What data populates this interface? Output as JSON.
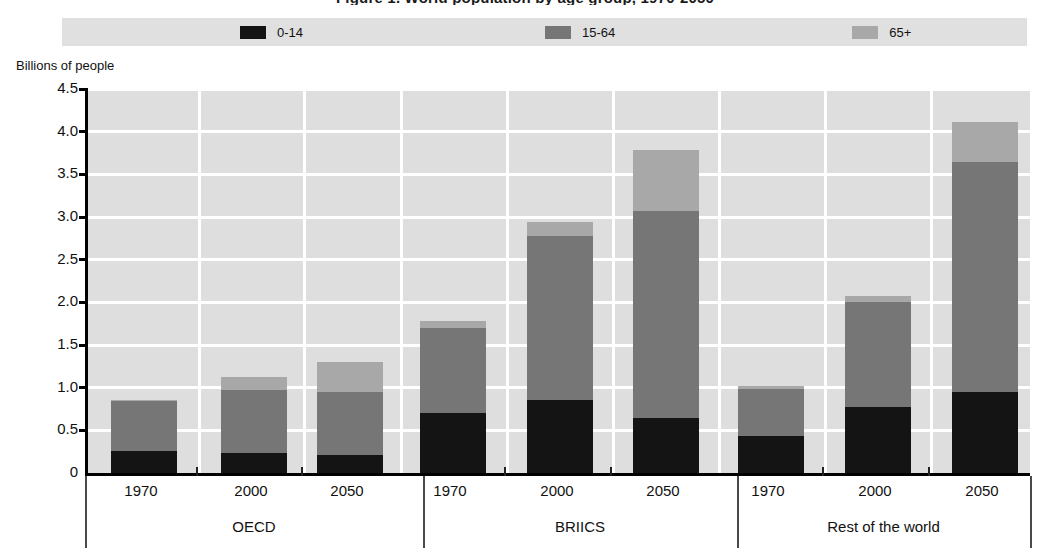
{
  "title": "Figure 1. World population by age group, 1970-2050",
  "legend": {
    "position": "top",
    "items": [
      {
        "label": "0-14",
        "color": "#141414",
        "icon": "legend-swatch"
      },
      {
        "label": "15-64",
        "color": "#767676",
        "icon": "legend-swatch"
      },
      {
        "label": "65+",
        "color": "#a8a8a8",
        "icon": "legend-swatch"
      }
    ]
  },
  "axes": {
    "y_caption": "Billions of people",
    "y_ticks": [
      "4.5",
      "4.0",
      "3.5",
      "3.0",
      "2.5",
      "2.0",
      "1.5",
      "1.0",
      "0.5",
      "0"
    ],
    "y_min": 0,
    "y_max": 4.5,
    "y_step": 0.5
  },
  "groups": [
    {
      "name": "OECD",
      "years": [
        "1970",
        "2000",
        "2050"
      ]
    },
    {
      "name": "BRIICS",
      "years": [
        "1970",
        "2000",
        "2050"
      ]
    },
    {
      "name": "Rest of the world",
      "years": [
        "1970",
        "2000",
        "2050"
      ]
    }
  ],
  "chart_data": {
    "type": "bar",
    "subtype": "stacked-grouped",
    "title": "Figure 1. World population by age group, 1970-2050",
    "xlabel": "",
    "ylabel": "Billions of people",
    "ylim": [
      0,
      4.5
    ],
    "ytick_step": 0.5,
    "grid": true,
    "legend_position": "top",
    "groups": [
      "OECD",
      "BRIICS",
      "Rest of the world"
    ],
    "categories": [
      "OECD 1970",
      "OECD 2000",
      "OECD 2050",
      "BRIICS 1970",
      "BRIICS 2000",
      "BRIICS 2050",
      "Rest of the world 1970",
      "Rest of the world 2000",
      "Rest of the world 2050"
    ],
    "series": [
      {
        "name": "0-14",
        "color": "#141414",
        "values": [
          0.26,
          0.23,
          0.21,
          0.7,
          0.86,
          0.64,
          0.43,
          0.77,
          0.95
        ]
      },
      {
        "name": "15-64",
        "color": "#767676",
        "values": [
          0.59,
          0.74,
          0.74,
          1.0,
          1.92,
          2.43,
          0.55,
          1.23,
          2.7
        ]
      },
      {
        "name": "65+",
        "color": "#a8a8a8",
        "values": [
          0.01,
          0.16,
          0.35,
          0.08,
          0.16,
          0.71,
          0.04,
          0.07,
          0.46
        ]
      }
    ],
    "totals": [
      0.86,
      1.13,
      1.3,
      1.78,
      2.94,
      3.78,
      1.02,
      2.07,
      4.11
    ]
  }
}
